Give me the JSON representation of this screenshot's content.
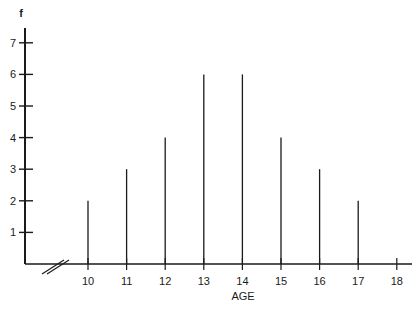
{
  "chart_data": {
    "type": "bar",
    "style": "spike",
    "title": "",
    "xlabel": "AGE",
    "ylabel": "f",
    "categories": [
      "10",
      "11",
      "12",
      "13",
      "14",
      "15",
      "16",
      "17"
    ],
    "values": [
      2,
      3,
      4,
      6,
      6,
      4,
      3,
      2
    ],
    "x_ticks": [
      "10",
      "11",
      "12",
      "13",
      "14",
      "15",
      "16",
      "17",
      "18"
    ],
    "y_ticks": [
      "1",
      "2",
      "3",
      "4",
      "5",
      "6",
      "7"
    ],
    "ylim": [
      0,
      7.5
    ],
    "xlim": [
      9.5,
      18.4
    ],
    "grid": false,
    "axis_break": true,
    "legend": null,
    "line_color": "#1a1a1a"
  }
}
